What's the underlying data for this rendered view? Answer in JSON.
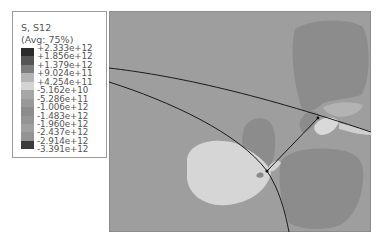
{
  "legend": {
    "title": "S, S12",
    "subtitle": "(Avg: 75%)",
    "levels": [
      {
        "label": "+2.333e+12",
        "color": "#2b2b2b"
      },
      {
        "label": "+1.856e+12",
        "color": "#555555"
      },
      {
        "label": "+1.379e+12",
        "color": "#7d7d7d"
      },
      {
        "label": "+9.024e+11",
        "color": "#b4b4b4"
      },
      {
        "label": "+4.254e+11",
        "color": "#d4d4d4"
      },
      {
        "label": "-5.162e+10",
        "color": "#a6a6a6"
      },
      {
        "label": "-5.286e+11",
        "color": "#999999"
      },
      {
        "label": "-1.006e+12",
        "color": "#8c8c8c"
      },
      {
        "label": "-1.483e+12",
        "color": "#959595"
      },
      {
        "label": "-1.960e+12",
        "color": "#a0a0a0"
      },
      {
        "label": "-2.437e+12",
        "color": "#939393"
      },
      {
        "label": "-2.914e+12",
        "color": "#3a3a3a"
      },
      {
        "label": "-3.391e+12",
        "color": "#1e1e1e"
      }
    ]
  },
  "plot": {
    "background_color": "#9e9e9e",
    "dark_region_color": "#8a8a8a",
    "light_region_color": "#d9d9d9",
    "mid_light_color": "#b7b7b7",
    "boundary_color": "#1a1a1a"
  }
}
